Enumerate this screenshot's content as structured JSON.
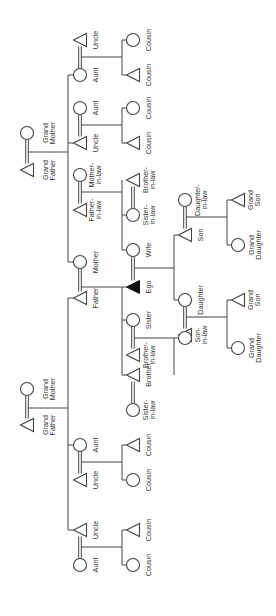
{
  "colors": {
    "line": "#444444",
    "ego_fill": "#111111",
    "background": "#ffffff"
  },
  "legend": {
    "triangle": "male",
    "circle": "female",
    "filled_triangle": "ego",
    "double_line": "marriage"
  },
  "labels": {
    "pgf": [
      "Grand",
      "Father"
    ],
    "pgm": [
      "Grand",
      "Mother"
    ],
    "mgf": [
      "Grand",
      "Father"
    ],
    "mgm": [
      "Grand",
      "Mother"
    ],
    "p_aunt1": "Aunt",
    "p_uncle1": "Uncle",
    "p_uncle2": "Uncle",
    "p_aunt2": "Aunt",
    "father": "Father",
    "mother": "Mother",
    "m_uncle1": "Uncle",
    "m_aunt1": "Aunt",
    "m_aunt2": "Aunt",
    "m_uncle2": "Uncle",
    "fil": [
      "Father-",
      "in-law"
    ],
    "mil": [
      "Mother-",
      "in-law"
    ],
    "cousin": "Cousin",
    "ego": "Ego",
    "wife": "Wife",
    "sister": "Sister",
    "brother": "Brother",
    "bil_sis": [
      "Brother-",
      "in-law"
    ],
    "sil_bro": [
      "Sister-",
      "in-law"
    ],
    "sil_wife": [
      "Sister-",
      "in-law"
    ],
    "bil_wife": [
      "Brother-",
      "in-law"
    ],
    "nephew": "Nephew",
    "niece": "Niece",
    "daughter": "Daughter",
    "son_in_law": [
      "Son-",
      "in-law"
    ],
    "son": "Son",
    "daughter_in_law": [
      "Daughter-",
      "in-law"
    ],
    "grand_son": [
      "Grand",
      "Son"
    ],
    "grand_daughter": [
      "Grand",
      "Daughter"
    ]
  }
}
